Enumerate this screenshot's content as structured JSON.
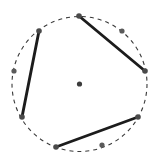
{
  "figure": {
    "title": "",
    "type": "geometry-diagram",
    "background_color": "#ffffff",
    "canvas": {
      "width": 155,
      "height": 160
    },
    "circle": {
      "name": "dashed-circle",
      "center": {
        "x": 79.5,
        "y": 84
      },
      "radius": 67.5,
      "stroke_color": "#3a3a3a",
      "stroke_width": 1.1,
      "dash_pattern": "4 4",
      "fill": "none"
    },
    "center_point": {
      "name": "circle-center-point",
      "x": 79.5,
      "y": 84,
      "radius": 2.6,
      "color": "#3c3c3c"
    },
    "points": [
      {
        "id": "p-top",
        "x": 79,
        "y": 16,
        "on_circle": true,
        "connected": true,
        "radius": 2.8,
        "color": "#4a4a4a"
      },
      {
        "id": "p-upper-left",
        "x": 39,
        "y": 31,
        "on_circle": true,
        "connected": true,
        "radius": 2.8,
        "color": "#4a4a4a"
      },
      {
        "id": "p-upper-right",
        "x": 122,
        "y": 31,
        "on_circle": true,
        "connected": false,
        "radius": 2.6,
        "color": "#5a5a5a"
      },
      {
        "id": "p-left",
        "x": 14,
        "y": 71,
        "on_circle": true,
        "connected": false,
        "radius": 2.6,
        "color": "#5a5a5a"
      },
      {
        "id": "p-right",
        "x": 145,
        "y": 71,
        "on_circle": true,
        "connected": true,
        "radius": 2.8,
        "color": "#4a4a4a"
      },
      {
        "id": "p-lower-left",
        "x": 22,
        "y": 117,
        "on_circle": true,
        "connected": true,
        "radius": 2.8,
        "color": "#4a4a4a"
      },
      {
        "id": "p-lower-right",
        "x": 138,
        "y": 117,
        "on_circle": true,
        "connected": true,
        "radius": 2.8,
        "color": "#4a4a4a"
      },
      {
        "id": "p-bottom",
        "x": 56,
        "y": 147,
        "on_circle": true,
        "connected": true,
        "radius": 2.8,
        "color": "#4a4a4a"
      },
      {
        "id": "p-bottom-right",
        "x": 102,
        "y": 145,
        "on_circle": true,
        "connected": false,
        "radius": 2.6,
        "color": "#5a5a5a"
      }
    ],
    "chords": [
      {
        "id": "chord-left",
        "from": "p-upper-left",
        "to": "p-lower-left",
        "x1": 39,
        "y1": 31,
        "x2": 22,
        "y2": 117,
        "stroke_color": "#1c1c1c",
        "stroke_width": 2.9
      },
      {
        "id": "chord-upper-right",
        "from": "p-top",
        "to": "p-right",
        "x1": 79,
        "y1": 16,
        "x2": 145,
        "y2": 71,
        "stroke_color": "#1c1c1c",
        "stroke_width": 2.9
      },
      {
        "id": "chord-bottom",
        "from": "p-bottom",
        "to": "p-lower-right",
        "x1": 56,
        "y1": 147,
        "x2": 138,
        "y2": 117,
        "stroke_color": "#1c1c1c",
        "stroke_width": 2.9
      }
    ]
  }
}
